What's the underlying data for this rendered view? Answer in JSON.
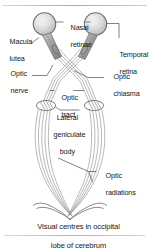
{
  "figure": {
    "caption": {
      "line1": "Visual centres in occipital",
      "line2": "lobe of cerebrum"
    },
    "labels": [
      {
        "id": "macula-lutea",
        "text_line1": "Macula",
        "text_line2": "lutea –"
      },
      {
        "id": "nasal-retinae",
        "text_line1": "Nasal",
        "text_line2": "retinae"
      },
      {
        "id": "temporal-retina",
        "text_line1": "Temporal",
        "text_line2": "retina"
      },
      {
        "id": "optic-nerve",
        "text_line1": "Optic",
        "text_line2": "nerve —"
      },
      {
        "id": "optic-chiasma",
        "text_line1": "Optic",
        "text_line2": "chiasma"
      },
      {
        "id": "optic-tract",
        "text_line1": "–Optic–",
        "text_line2": "tract"
      },
      {
        "id": "lateral-geniculate-body",
        "text_line1": "Lateral—",
        "text_line2": "geniculate",
        "text_line3": "body"
      },
      {
        "id": "optic-radiations",
        "text_line1": "Optic",
        "text_line2": "radiations"
      }
    ],
    "label_text": {
      "macula_l1": "Macula",
      "macula_l2": "lutea",
      "nasal_l1": "Nasal",
      "nasal_l2": "retinae",
      "temporal_l1": "Temporal",
      "temporal_l2": "retina",
      "optic_nerve_l1": "Optic",
      "optic_nerve_l2": "nerve",
      "chiasma_l1": "Optic",
      "chiasma_l2": "chiasma",
      "tract_l1": "Optic",
      "tract_l2": "tract",
      "lgb_l1": "Lateral",
      "lgb_l2": "geniculate",
      "lgb_l3": "body",
      "radiations_l1": "Optic",
      "radiations_l2": "radiations"
    },
    "colors": {
      "ink": "#161616",
      "line": "#5a5a5a",
      "pathway": "#8c8c8c",
      "eye_fill": "#dedede",
      "eye_edge": "#6e6e6e",
      "background": "#ffffff",
      "rule": "#b0b0b0"
    },
    "anatomy": {
      "eyeballs": 2,
      "geniculate_bodies": 2,
      "pathway_strands_per_side": 4
    }
  }
}
